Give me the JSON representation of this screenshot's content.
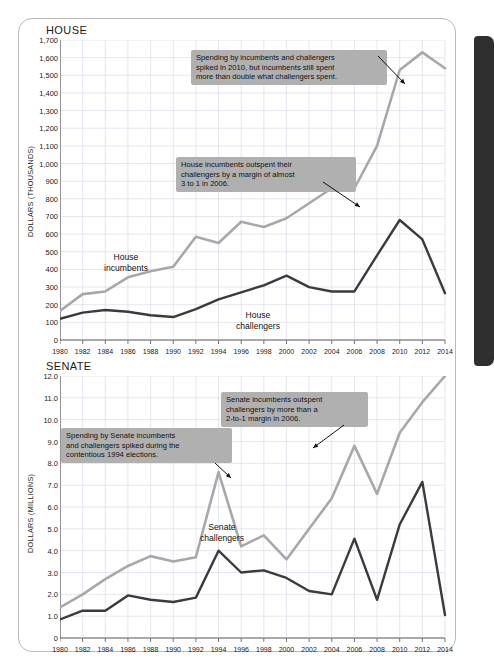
{
  "colors": {
    "incumbent_line": "#a8a8a8",
    "challenger_line": "#3b3b3b",
    "callout_bg": "#b0b0b0",
    "grid": "#c9cfe0",
    "axis": "#555555",
    "spine": "#2f2f2f"
  },
  "house": {
    "title": "HOUSE",
    "ylabel": "DOLLARS (THOUSANDS)",
    "callouts": [
      {
        "id": "house-callout-2010",
        "lines": [
          "Spending by incumbents and challengers",
          "spiked in 2010, but incumbents still spent",
          "more than double what challengers spent."
        ]
      },
      {
        "id": "house-callout-2006",
        "lines": [
          "House incumbents outspent their",
          "challengers by a margin of almost",
          "3 to 1 in 2006."
        ]
      }
    ],
    "series_labels": {
      "incumbents": [
        "House",
        "incumbents"
      ],
      "challengers": [
        "House",
        "challengers"
      ]
    }
  },
  "senate": {
    "title": "SENATE",
    "ylabel": "DOLLARS (MILLIONS)",
    "callouts": [
      {
        "id": "senate-callout-2006",
        "lines": [
          "Senate incumbents outspent",
          "challengers by more than a",
          "2-to-1 margin in 2006."
        ]
      },
      {
        "id": "senate-callout-1994",
        "lines": [
          "Spending by Senate incumbents",
          "and challengers spiked during the",
          "contentious 1994 elections."
        ]
      }
    ],
    "series_labels": {
      "incumbents": [
        "Senate",
        "incumbents"
      ],
      "challengers": [
        "Senate",
        "challengers"
      ]
    }
  },
  "chart_data": [
    {
      "type": "line",
      "title": "HOUSE",
      "xlabel": "",
      "ylabel": "DOLLARS (THOUSANDS)",
      "grid": true,
      "legend": "inline-labels",
      "x": [
        1980,
        1982,
        1984,
        1986,
        1988,
        1990,
        1992,
        1994,
        1996,
        1998,
        2000,
        2002,
        2004,
        2006,
        2008,
        2010,
        2012,
        2014
      ],
      "xlim": [
        1980,
        2014
      ],
      "ylim": [
        0,
        1700
      ],
      "ytick_labels": [
        "0",
        "100",
        "200",
        "300",
        "400",
        "500",
        "600",
        "700",
        "800",
        "900",
        "1,000",
        "1,100",
        "1,200",
        "1,300",
        "1,400",
        "1,500",
        "1,600",
        "1,700"
      ],
      "xtick_labels": [
        "1980",
        "1982",
        "1984",
        "1986",
        "1988",
        "1990",
        "1992",
        "1994",
        "1996",
        "1998",
        "2000",
        "2002",
        "2004",
        "2006",
        "2008",
        "2010",
        "2012",
        "2014"
      ],
      "series": [
        {
          "name": "House incumbents",
          "color": "#a8a8a8",
          "values": [
            165,
            260,
            275,
            355,
            390,
            415,
            585,
            550,
            670,
            640,
            690,
            775,
            860,
            860,
            1100,
            1530,
            1630,
            1540
          ]
        },
        {
          "name": "House challengers",
          "color": "#3b3b3b",
          "values": [
            120,
            155,
            170,
            160,
            140,
            130,
            175,
            230,
            270,
            310,
            365,
            300,
            275,
            275,
            480,
            680,
            570,
            265
          ]
        }
      ],
      "annotations": [
        {
          "text": "Spending by incumbents and challengers spiked in 2010, but incumbents still spent more than double what challengers spent.",
          "points_to_year": 2010,
          "points_to_series": "House incumbents"
        },
        {
          "text": "House incumbents outspent their challengers by a margin of almost 3 to 1 in 2006.",
          "points_to_year": 2006,
          "points_to_series": "House incumbents"
        }
      ]
    },
    {
      "type": "line",
      "title": "SENATE",
      "xlabel": "",
      "ylabel": "DOLLARS (MILLIONS)",
      "grid": true,
      "legend": "inline-labels",
      "x": [
        1980,
        1982,
        1984,
        1986,
        1988,
        1990,
        1992,
        1994,
        1996,
        1998,
        2000,
        2002,
        2004,
        2006,
        2008,
        2010,
        2012,
        2014
      ],
      "xlim": [
        1980,
        2014
      ],
      "ylim": [
        0,
        12
      ],
      "ytick_labels": [
        "0",
        "1.0",
        "2.0",
        "3.0",
        "4.0",
        "5.0",
        "6.0",
        "7.0",
        "8.0",
        "9.0",
        "10.0",
        "11.0",
        "12.0"
      ],
      "xtick_labels": [
        "1980",
        "1982",
        "1984",
        "1986",
        "1988",
        "1990",
        "1992",
        "1994",
        "1996",
        "1998",
        "2000",
        "2002",
        "2004",
        "2006",
        "2008",
        "2010",
        "2012",
        "2014"
      ],
      "series": [
        {
          "name": "Senate incumbents",
          "color": "#a8a8a8",
          "values": [
            1.4,
            2.0,
            2.7,
            3.3,
            3.75,
            3.5,
            3.7,
            7.6,
            4.2,
            4.7,
            3.6,
            5.0,
            6.4,
            8.8,
            6.6,
            9.4,
            10.8,
            12.0
          ]
        },
        {
          "name": "Senate challengers",
          "color": "#3b3b3b",
          "values": [
            0.85,
            1.25,
            1.25,
            1.95,
            1.75,
            1.65,
            1.85,
            4.0,
            3.0,
            3.1,
            2.75,
            2.15,
            2.0,
            4.55,
            1.75,
            5.2,
            7.15,
            1.05
          ]
        }
      ],
      "annotations": [
        {
          "text": "Senate incumbents outspent challengers by more than a 2-to-1 margin in 2006.",
          "points_to_year": 2006,
          "points_to_series": "Senate incumbents"
        },
        {
          "text": "Spending by Senate incumbents and challengers spiked during the contentious 1994 elections.",
          "points_to_year": 1994,
          "points_to_series": "Senate incumbents"
        }
      ]
    }
  ]
}
